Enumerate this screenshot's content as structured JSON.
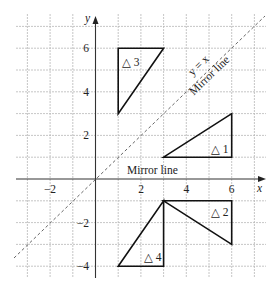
{
  "figure": {
    "x_axis_label": "x",
    "y_axis_label": "y",
    "x_ticks": [
      {
        "value": -2,
        "label": "−2"
      },
      {
        "value": 2,
        "label": "2"
      },
      {
        "value": 4,
        "label": "4"
      },
      {
        "value": 6,
        "label": "6"
      }
    ],
    "y_ticks": [
      {
        "value": 6,
        "label": "6"
      },
      {
        "value": 4,
        "label": "4"
      },
      {
        "value": 2,
        "label": "2"
      },
      {
        "value": -2,
        "label": "−2"
      },
      {
        "value": -4,
        "label": "−4"
      }
    ],
    "grid": {
      "x_min": -3,
      "x_max": 7,
      "y_min": -4,
      "y_max": 7,
      "step": 1
    },
    "mirror_lines": [
      {
        "equation": "y = x",
        "label": "Mirror line"
      },
      {
        "equation": "y = 0",
        "label": "Mirror line"
      }
    ],
    "triangles": [
      {
        "label": "△ 1",
        "vertices": [
          [
            3,
            1
          ],
          [
            6,
            1
          ],
          [
            6,
            3
          ]
        ]
      },
      {
        "label": "△ 2",
        "vertices": [
          [
            3,
            -1
          ],
          [
            6,
            -1
          ],
          [
            6,
            -3
          ]
        ]
      },
      {
        "label": "△ 3",
        "vertices": [
          [
            1,
            3
          ],
          [
            1,
            6
          ],
          [
            3,
            6
          ]
        ]
      },
      {
        "label": "△ 4",
        "vertices": [
          [
            3,
            -1
          ],
          [
            3,
            -4
          ],
          [
            1,
            -4
          ]
        ]
      }
    ],
    "diag_eq_label": "y = x",
    "diag_mirror_label": "Mirror line",
    "horiz_mirror_label": "Mirror line"
  }
}
